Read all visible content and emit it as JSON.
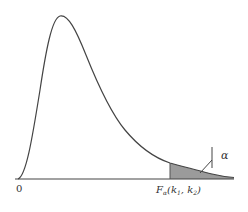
{
  "diagram": {
    "type": "probability-density-curve",
    "labels": {
      "origin": "0",
      "critical_value_main": "F",
      "critical_value_sub": "α",
      "critical_value_args": "(k",
      "k1_sub": "1",
      "comma": ", k",
      "k2_sub": "2",
      "close": ")",
      "alpha": "α"
    },
    "colors": {
      "curve": "#444444",
      "axis": "#444444",
      "shade": "#8a8a8a",
      "text": "#333333"
    }
  }
}
